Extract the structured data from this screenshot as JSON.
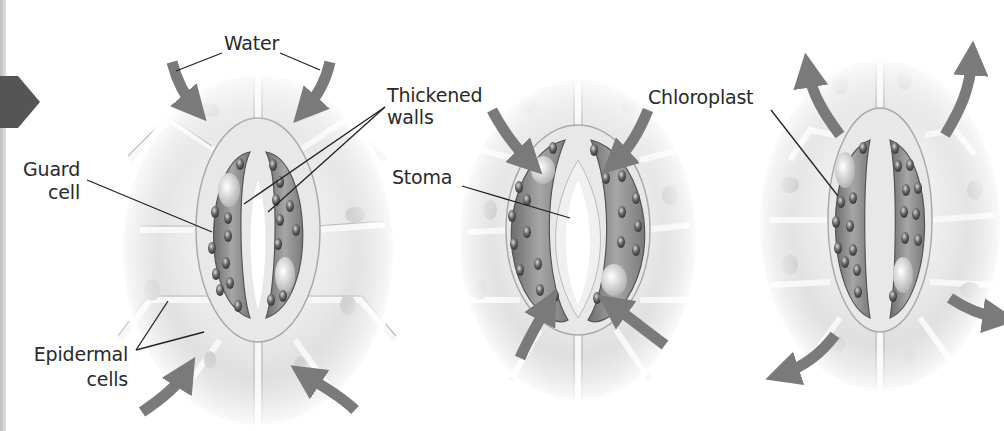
{
  "diagram": {
    "panels": [
      {
        "id": "open",
        "description": "Stoma open; water moves into guard cells"
      },
      {
        "id": "intermediate",
        "description": "Stoma partially open"
      },
      {
        "id": "closed",
        "description": "Stoma closed; water moves out of guard cells"
      }
    ],
    "labels": {
      "water": "Water",
      "thickened_walls_line1": "Thickened",
      "thickened_walls_line2": "walls",
      "guard_cell_line1": "Guard",
      "guard_cell_line2": "cell",
      "epidermal_cells_line1": "Epidermal",
      "epidermal_cells_line2": "cells",
      "stoma": "Stoma",
      "chloroplast": "Chloroplast"
    },
    "icons": {
      "left_arrow": "arrow-right-icon"
    },
    "colors": {
      "background": "#ffffff",
      "arrow": "#7a7a7a",
      "cell_fill": "#e4e4e4",
      "cell_wall": "#f4f4f4",
      "guard_cell": "#8a8a8a",
      "chloroplast": "#5a5a5a",
      "leader_line": "#222222",
      "text": "#2a2a2a"
    }
  }
}
